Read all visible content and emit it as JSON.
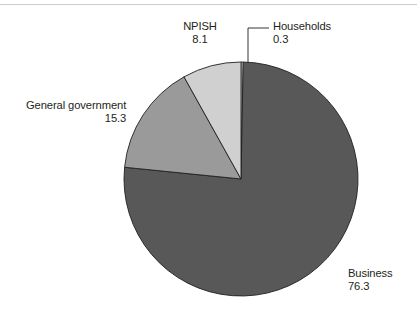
{
  "figure": {
    "background_color": "#ffffff",
    "rule_color": "#c9cbcd",
    "text_color": "#231f20"
  },
  "chart_data": {
    "type": "pie",
    "title": "",
    "subtitle": "",
    "xlabel": "",
    "ylabel": "",
    "legend_position": "none",
    "grid": false,
    "units": "percent",
    "total": 100.0,
    "start_angle_deg": 0,
    "direction": "clockwise",
    "categories": [
      "Households",
      "Business",
      "General government",
      "NPISH"
    ],
    "values": [
      0.3,
      76.3,
      15.3,
      8.1
    ],
    "colors": [
      "#f4f4f4",
      "#585858",
      "#9a9a9a",
      "#d0d0d0"
    ],
    "slice_border_color": "#231f20",
    "slices": [
      {
        "label": "Households",
        "value": 0.3,
        "value_text": "0.3",
        "color": "#f4f4f4",
        "leader_line": true
      },
      {
        "label": "Business",
        "value": 76.3,
        "value_text": "76.3",
        "color": "#585858",
        "leader_line": false
      },
      {
        "label": "General government",
        "value": 15.3,
        "value_text": "15.3",
        "color": "#9a9a9a",
        "leader_line": false
      },
      {
        "label": "NPISH",
        "value": 8.1,
        "value_text": "8.1",
        "color": "#d0d0d0",
        "leader_line": false
      }
    ]
  },
  "geometry": {
    "center_x": 241,
    "center_y": 179,
    "radius": 117
  }
}
